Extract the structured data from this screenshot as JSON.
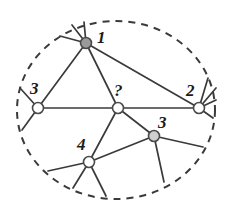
{
  "figure": {
    "background_color": "#ffffff",
    "stroke_color": "#3a3a3a",
    "node_stroke_color": "#4a4a4a",
    "node_fill_default": "#ffffff",
    "node_fill_highlight": "#9a9a9a",
    "label_color": "#1a1a1a",
    "width": 234,
    "height": 207
  },
  "boundary": {
    "name": "dashed-ellipse",
    "shape": "ellipse",
    "cx": 116,
    "cy": 110,
    "rx": 99,
    "ry": 89,
    "dash": "7 6",
    "stroke_width": 2
  },
  "nodes": [
    {
      "id": "n1",
      "label": "1",
      "x": 86,
      "y": 43,
      "r": 5.5,
      "fill": "#9a9a9a",
      "label_x": 97,
      "label_y": 29
    },
    {
      "id": "n3left",
      "label": "3",
      "x": 38,
      "y": 108,
      "r": 5.5,
      "fill": "#ffffff",
      "label_x": 30,
      "label_y": 80
    },
    {
      "id": "nq",
      "label": "?",
      "x": 118,
      "y": 108,
      "r": 5.5,
      "fill": "#ffffff",
      "label_x": 114,
      "label_y": 82
    },
    {
      "id": "n2",
      "label": "2",
      "x": 199,
      "y": 108,
      "r": 5.5,
      "fill": "#ffffff",
      "label_x": 186,
      "label_y": 82
    },
    {
      "id": "n3right",
      "label": "3",
      "x": 154,
      "y": 136,
      "r": 5.5,
      "fill": "#cfcfcf",
      "label_x": 158,
      "label_y": 114
    },
    {
      "id": "n4",
      "label": "4",
      "x": 89,
      "y": 162,
      "r": 5.5,
      "fill": "#ffffff",
      "label_x": 77,
      "label_y": 136
    }
  ],
  "edges": [
    {
      "from": "n1",
      "to": "n3left",
      "kind": "internal"
    },
    {
      "from": "n1",
      "to": "nq",
      "kind": "internal"
    },
    {
      "from": "n1",
      "to": "n2",
      "kind": "internal"
    },
    {
      "from": "n3left",
      "to": "nq",
      "kind": "internal"
    },
    {
      "from": "nq",
      "to": "n2",
      "kind": "internal"
    },
    {
      "from": "nq",
      "to": "n4",
      "kind": "internal"
    },
    {
      "from": "nq",
      "to": "n3right",
      "kind": "internal"
    },
    {
      "from": "n3right",
      "to": "n4",
      "kind": "internal"
    }
  ],
  "stubs": [
    {
      "from": "n1",
      "x2": 60,
      "y2": 36
    },
    {
      "from": "n1",
      "x2": 72,
      "y2": 25
    },
    {
      "from": "n1",
      "x2": 84,
      "y2": 22
    },
    {
      "from": "n3left",
      "x2": 20,
      "y2": 88
    },
    {
      "from": "n3left",
      "x2": 22,
      "y2": 130
    },
    {
      "from": "n2",
      "x2": 208,
      "y2": 78
    },
    {
      "from": "n2",
      "x2": 216,
      "y2": 88
    },
    {
      "from": "n2",
      "x2": 216,
      "y2": 100
    },
    {
      "from": "n2",
      "x2": 213,
      "y2": 118
    },
    {
      "from": "n3right",
      "x2": 203,
      "y2": 147
    },
    {
      "from": "n3right",
      "x2": 164,
      "y2": 182
    },
    {
      "from": "n4",
      "x2": 48,
      "y2": 171
    },
    {
      "from": "n4",
      "x2": 73,
      "y2": 188
    },
    {
      "from": "n4",
      "x2": 106,
      "y2": 196
    }
  ]
}
